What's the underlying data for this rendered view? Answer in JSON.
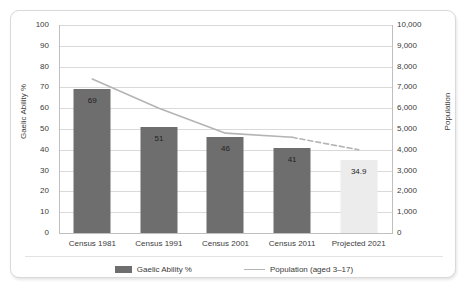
{
  "chart_data": {
    "type": "bar",
    "title": "",
    "subtitle": "",
    "xlabel": "",
    "ylabel": "Gaelic Ability %",
    "y2label": "Population",
    "categories": [
      "Census 1981",
      "Census 1991",
      "Census 2001",
      "Census 2011",
      "Projected 2021"
    ],
    "ylim": [
      0,
      100
    ],
    "y2lim": [
      0,
      10000
    ],
    "yticks": [
      "100",
      "90",
      "80",
      "70",
      "60",
      "50",
      "40",
      "30",
      "20",
      "10",
      "0"
    ],
    "ytick_values": [
      100,
      90,
      80,
      70,
      60,
      50,
      40,
      30,
      20,
      10,
      0
    ],
    "y2ticks": [
      "10,000",
      "9,000",
      "8,000",
      "7,000",
      "6,000",
      "5,000",
      "4,000",
      "3,000",
      "2,000",
      "1,000",
      "0"
    ],
    "y2tick_values": [
      10000,
      9000,
      8000,
      7000,
      6000,
      5000,
      4000,
      3000,
      2000,
      1000,
      0
    ],
    "grid": true,
    "legend_position": "bottom",
    "series": [
      {
        "name": "Gaelic Ability %",
        "type": "bar",
        "axis": "left",
        "color": "#6e6e6e",
        "projected_color": "#ececec",
        "values": [
          69,
          51,
          46,
          41,
          34.9
        ],
        "labels": [
          "69",
          "51",
          "46",
          "41",
          "34.9"
        ],
        "projected_index": 4
      },
      {
        "name": "Population (aged 3–17)",
        "type": "line",
        "axis": "right",
        "color": "#b4b4b4",
        "values": [
          7400,
          6000,
          4800,
          4600,
          4000
        ],
        "dashed_from_index": 3
      }
    ]
  },
  "legend": {
    "items": [
      {
        "label": "Gaelic Ability %",
        "marker": "bar-swatch",
        "color": "#6e6e6e"
      },
      {
        "label": "Population (aged 3–17)",
        "marker": "line-swatch",
        "color": "#b4b4b4"
      }
    ]
  }
}
